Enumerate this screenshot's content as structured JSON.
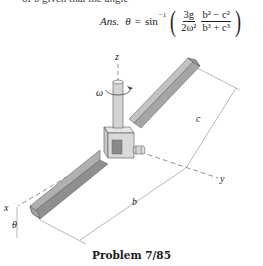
{
  "header": {
    "cropped_text": "of θ given that the angle"
  },
  "answer": {
    "prefix": "Ans.",
    "variable": "θ",
    "equals": "=",
    "function": "sin",
    "function_exponent": "−1",
    "left_paren": "(",
    "right_paren": ")",
    "fraction1": {
      "numerator": "3g",
      "denominator": "2ω²"
    },
    "fraction2": {
      "numerator": "b² − c²",
      "denominator": "b³ + c³"
    }
  },
  "diagram": {
    "labels": {
      "z_axis": "z",
      "y_axis": "y",
      "x_axis": "x",
      "omega": "ω",
      "theta": "θ",
      "length_b": "b",
      "length_c": "c"
    },
    "colors": {
      "bar_top": "#b5b5b5",
      "bar_side": "#8a8a8a",
      "bar_end": "#a0a0a0",
      "collar": "#d8d8d8",
      "shaft": "#d0d0d0",
      "axis_line": "#666666",
      "dimension_line": "#888888"
    }
  },
  "caption": "Problem 7/85"
}
